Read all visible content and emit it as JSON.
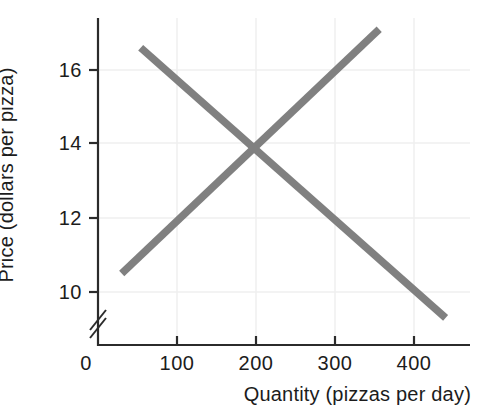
{
  "chart_data": {
    "type": "line",
    "title": "",
    "xlabel": "Quantity (pizzas per day)",
    "ylabel": "Price (dollars per pizza)",
    "xlim": [
      0,
      470
    ],
    "ylim": [
      9,
      17.6
    ],
    "y_axis_break": true,
    "grid": true,
    "legend": "none",
    "xticks": [
      0,
      100,
      200,
      300,
      400
    ],
    "xtick_labels": [
      "0",
      "100",
      "200",
      "300",
      "400"
    ],
    "yticks": [
      10,
      12,
      14,
      16
    ],
    "ytick_labels": [
      "10",
      "12",
      "14",
      "16"
    ],
    "series": [
      {
        "name": "demand",
        "direction": "downward-sloping",
        "color": "#808080",
        "x": [
          54,
          440
        ],
        "values": [
          16.6,
          9.3
        ]
      },
      {
        "name": "supply",
        "direction": "upward-sloping",
        "color": "#808080",
        "x": [
          30,
          356
        ],
        "values": [
          10.5,
          17.1
        ]
      }
    ],
    "equilibrium": {
      "quantity": 200,
      "price": 14
    }
  },
  "colors": {
    "line": "#808080",
    "axis": "#2b2b2b",
    "grid": "#efefef",
    "background": "#ffffff",
    "text": "#1c1c1c"
  },
  "axes": {
    "y_title": "Price (dollars per pizza)",
    "x_title": "Quantity (pizzas per day)",
    "origin_label": "0"
  },
  "y_tick_labels": [
    "16",
    "14",
    "12",
    "10"
  ],
  "x_tick_labels": [
    "100",
    "200",
    "300",
    "400"
  ]
}
